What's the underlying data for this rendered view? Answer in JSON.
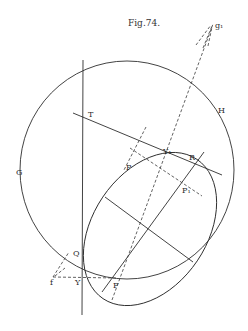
{
  "figure": {
    "title": "Fig.74.",
    "labels": {
      "g1": "g₁",
      "H": "H",
      "T": "T",
      "G": "G",
      "Y1": "Y₁",
      "R": "R",
      "P": "P",
      "P1": "P₁",
      "Q": "Q",
      "f": "f",
      "Y": "Y",
      "F": "F"
    }
  }
}
